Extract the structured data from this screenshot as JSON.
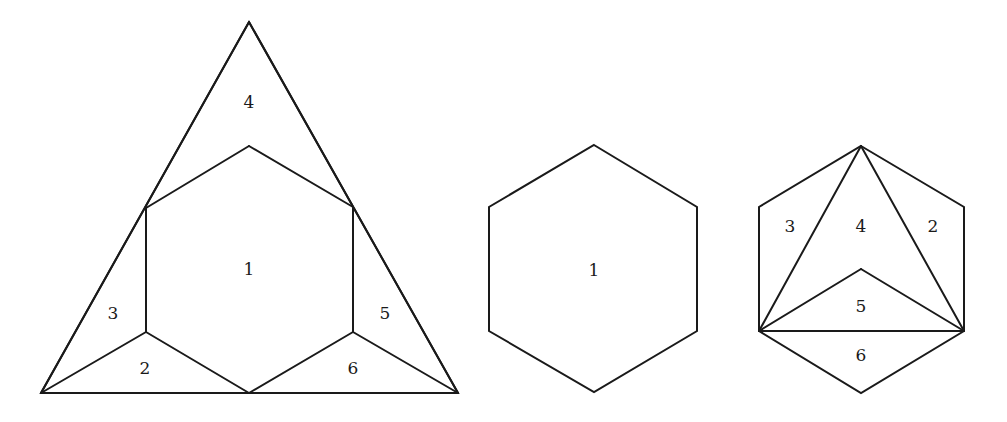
{
  "figures": [
    {
      "id": "triangle-dissection",
      "description": "Equilateral triangle dissected into a central hexagon and five surrounding pieces",
      "outline": [
        [
          249,
          22
        ],
        [
          458,
          393
        ],
        [
          41,
          393
        ]
      ],
      "edges": [
        [
          [
            249,
            22
          ],
          [
            458,
            393
          ]
        ],
        [
          [
            458,
            393
          ],
          [
            41,
            393
          ]
        ],
        [
          [
            41,
            393
          ],
          [
            249,
            22
          ]
        ],
        [
          [
            146,
            208
          ],
          [
            249,
            146
          ]
        ],
        [
          [
            249,
            146
          ],
          [
            353,
            207
          ]
        ],
        [
          [
            146,
            208
          ],
          [
            146,
            332
          ]
        ],
        [
          [
            353,
            207
          ],
          [
            353,
            332
          ]
        ],
        [
          [
            146,
            332
          ],
          [
            249,
            393
          ]
        ],
        [
          [
            353,
            332
          ],
          [
            249,
            393
          ]
        ],
        [
          [
            41,
            393
          ],
          [
            146,
            332
          ]
        ],
        [
          [
            458,
            393
          ],
          [
            353,
            332
          ]
        ]
      ],
      "labels": [
        {
          "text": "4",
          "x": 249,
          "y": 102
        },
        {
          "text": "1",
          "x": 249,
          "y": 269
        },
        {
          "text": "3",
          "x": 113,
          "y": 313
        },
        {
          "text": "2",
          "x": 145,
          "y": 368
        },
        {
          "text": "5",
          "x": 385,
          "y": 313
        },
        {
          "text": "6",
          "x": 353,
          "y": 368
        }
      ]
    },
    {
      "id": "hexagon-plain",
      "description": "Regular hexagon (piece 1)",
      "outline": [
        [
          594,
          145
        ],
        [
          697,
          207
        ],
        [
          697,
          331
        ],
        [
          594,
          392
        ],
        [
          489,
          331
        ],
        [
          489,
          207
        ]
      ],
      "edges": [],
      "labels": [
        {
          "text": "1",
          "x": 594,
          "y": 270
        }
      ]
    },
    {
      "id": "hexagon-reassembled",
      "description": "Hexagon formed by rearranged pieces 2-6",
      "outline": [
        [
          861,
          146
        ],
        [
          964,
          207
        ],
        [
          964,
          331
        ],
        [
          861,
          393
        ],
        [
          759,
          331
        ],
        [
          759,
          207
        ]
      ],
      "edges": [
        [
          [
            759,
            331
          ],
          [
            964,
            331
          ]
        ],
        [
          [
            861,
            146
          ],
          [
            759,
            331
          ]
        ],
        [
          [
            861,
            146
          ],
          [
            964,
            331
          ]
        ],
        [
          [
            759,
            331
          ],
          [
            861,
            269
          ]
        ],
        [
          [
            861,
            269
          ],
          [
            964,
            331
          ]
        ]
      ],
      "labels": [
        {
          "text": "3",
          "x": 790,
          "y": 226
        },
        {
          "text": "4",
          "x": 861,
          "y": 226
        },
        {
          "text": "2",
          "x": 933,
          "y": 226
        },
        {
          "text": "5",
          "x": 861,
          "y": 306
        },
        {
          "text": "6",
          "x": 861,
          "y": 355
        }
      ]
    }
  ],
  "style": {
    "stroke_color": "#1a1a1a",
    "background": "#ffffff"
  }
}
